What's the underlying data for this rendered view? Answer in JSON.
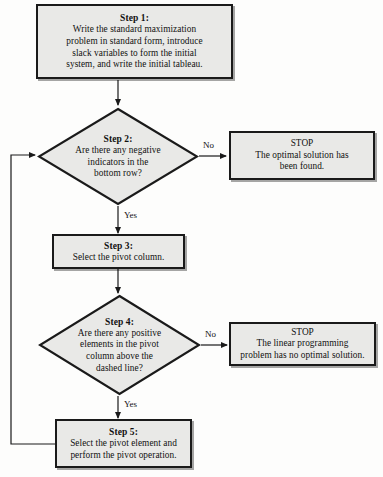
{
  "diagram": {
    "type": "flowchart",
    "shape_fill": "#e9e9e7",
    "stroke": "#1a1a1a",
    "background": "#fdfdfc"
  },
  "nodes": {
    "step1": {
      "shape": "process",
      "title": "Step 1:",
      "lines": [
        "Write the standard maximization",
        "problem in standard form, introduce",
        "slack variables to form the initial",
        "system, and write the initial tableau."
      ]
    },
    "step2": {
      "shape": "decision",
      "title": "Step 2:",
      "lines": [
        "Are there any negative",
        "indicators in the",
        "bottom row?"
      ]
    },
    "stop1": {
      "shape": "process",
      "title": "STOP",
      "lines": [
        "The optimal solution has",
        "been found."
      ]
    },
    "step3": {
      "shape": "process",
      "title": "Step 3:",
      "lines": [
        "Select the pivot column."
      ]
    },
    "step4": {
      "shape": "decision",
      "title": "Step 4:",
      "lines": [
        "Are there any positive",
        "elements in the pivot",
        "column above the",
        "dashed line?"
      ]
    },
    "stop2": {
      "shape": "process",
      "title": "STOP",
      "lines": [
        "The linear programming",
        "problem has no optimal solution."
      ]
    },
    "step5": {
      "shape": "process",
      "title": "Step 5:",
      "lines": [
        "Select the pivot element and",
        "perform the pivot operation."
      ]
    }
  },
  "edges": {
    "step2_no": "No",
    "step2_yes": "Yes",
    "step4_no": "No",
    "step4_yes": "Yes"
  }
}
